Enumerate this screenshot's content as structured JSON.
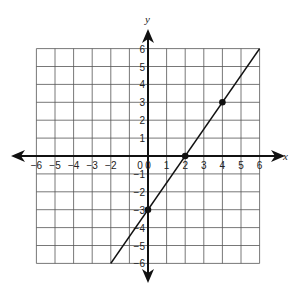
{
  "chart_data": {
    "type": "line",
    "title": "",
    "xlabel": "x",
    "ylabel": "y",
    "xlim": [
      -6,
      6
    ],
    "ylim": [
      -6,
      6
    ],
    "grid": true,
    "x_ticks": [
      -6,
      -5,
      -4,
      -3,
      -2,
      0,
      1,
      2,
      3,
      4,
      5,
      6
    ],
    "y_ticks": [
      6,
      5,
      4,
      3,
      2,
      1,
      -1,
      -2,
      -3,
      -4,
      -5,
      -6
    ],
    "origin_label": "0",
    "series": [
      {
        "name": "line",
        "equation": "y = 1.5x - 3",
        "segment": [
          [
            -2,
            -6
          ],
          [
            6,
            6
          ]
        ],
        "x": [
          -2,
          0,
          2,
          4,
          6
        ],
        "y": [
          -6,
          -3,
          0,
          3,
          6
        ]
      }
    ],
    "points": [
      {
        "x": 0,
        "y": -3
      },
      {
        "x": 2,
        "y": 0
      },
      {
        "x": 4,
        "y": 3
      }
    ]
  },
  "colors": {
    "grid": "#555555",
    "axis": "#111111",
    "line": "#111111",
    "point": "#111111"
  }
}
